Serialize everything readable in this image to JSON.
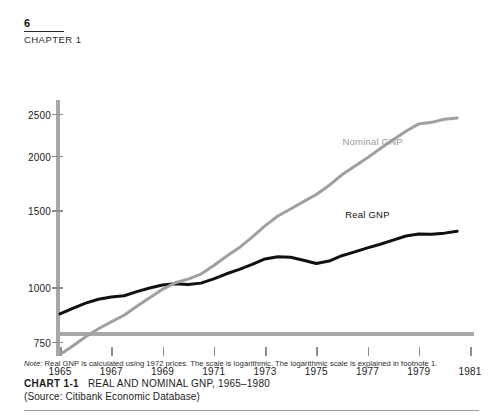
{
  "header": {
    "page_number": "6",
    "chapter_label": "CHAPTER 1"
  },
  "caption": {
    "note_prefix": "Note:",
    "note_text": "Real GNP is calculated using 1972 prices.  The scale is logarithmic.  The logarithmic scale is explained in footnote 1.",
    "chart_number": "CHART 1-1",
    "chart_title": "REAL AND NOMINAL GNP, 1965–1980",
    "source": "(Source: Citibank Economic Database)"
  },
  "colors": {
    "nominal": "#a0a0a0",
    "real": "#111111",
    "axis": "#a8a8a8",
    "tick": "#8d8d8d",
    "text": "#1c1c1c"
  },
  "chart_data": {
    "type": "line",
    "title": "REAL AND NOMINAL GNP, 1965–1980",
    "xlabel": "",
    "ylabel": "",
    "yscale": "log",
    "grid": false,
    "legend": "inline-annotation",
    "xlim": [
      1965,
      1981
    ],
    "ylim": [
      700,
      2700
    ],
    "xticks": [
      "1965",
      "1967",
      "1969",
      "1971",
      "1973",
      "1975",
      "1977",
      "1979",
      "1981"
    ],
    "yticks": [
      "750",
      "1000",
      "1500",
      "2000",
      "2500"
    ],
    "ytick_values": [
      750,
      1000,
      1500,
      2000,
      2500
    ],
    "annotations": [
      {
        "text": "Nominal GNP",
        "x": 1977.2,
        "y": 2180
      },
      {
        "text": "Real GNP",
        "x": 1977.0,
        "y": 1480
      }
    ],
    "x": [
      1965,
      1965.5,
      1966,
      1966.5,
      1967,
      1967.5,
      1968,
      1968.5,
      1969,
      1969.5,
      1970,
      1970.5,
      1971,
      1971.5,
      1972,
      1972.5,
      1973,
      1973.5,
      1974,
      1974.5,
      1975,
      1975.5,
      1976,
      1976.5,
      1977,
      1977.5,
      1978,
      1978.5,
      1979,
      1979.5,
      1980,
      1980.5
    ],
    "series": [
      {
        "name": "Real GNP",
        "color": "#111111",
        "values": [
          874,
          900,
          925,
          944,
          955,
          962,
          983,
          1002,
          1018,
          1025,
          1021,
          1028,
          1051,
          1080,
          1105,
          1135,
          1168,
          1182,
          1178,
          1160,
          1140,
          1155,
          1188,
          1212,
          1238,
          1262,
          1290,
          1318,
          1332,
          1330,
          1338,
          1352
        ]
      },
      {
        "name": "Nominal GNP",
        "color": "#a0a0a0",
        "values": [
          706,
          738,
          775,
          808,
          838,
          868,
          910,
          952,
          995,
          1030,
          1050,
          1078,
          1128,
          1185,
          1240,
          1310,
          1390,
          1465,
          1520,
          1580,
          1640,
          1720,
          1820,
          1905,
          1990,
          2090,
          2190,
          2290,
          2380,
          2400,
          2440,
          2455
        ]
      }
    ]
  }
}
